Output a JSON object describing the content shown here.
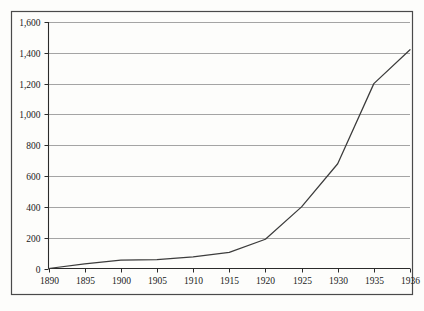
{
  "chart_data": {
    "type": "line",
    "title": "",
    "subtitle": "",
    "xlabel": "",
    "ylabel": "",
    "x": [
      1890,
      1895,
      1900,
      1905,
      1910,
      1915,
      1920,
      1925,
      1930,
      1935,
      1936
    ],
    "values": [
      0,
      30,
      55,
      58,
      75,
      105,
      190,
      400,
      680,
      1200,
      1420
    ],
    "series": [
      {
        "name": "",
        "values": [
          0,
          30,
          55,
          58,
          75,
          105,
          190,
          400,
          680,
          1200,
          1420
        ]
      }
    ],
    "x_tick_labels": [
      "1890",
      "1895",
      "1900",
      "1905",
      "1910",
      "1915",
      "1920",
      "1925",
      "1930",
      "1935",
      "1936"
    ],
    "y_tick_labels": [
      "0",
      "200",
      "400",
      "600",
      "800",
      "1,000",
      "1,200",
      "1,400",
      "1,600"
    ],
    "y_ticks": [
      0,
      200,
      400,
      600,
      800,
      1000,
      1200,
      1400,
      1600
    ],
    "ylim": [
      0,
      1600
    ],
    "xlim": [
      1890,
      1936
    ],
    "grid": "horizontal",
    "legend": "none",
    "line_color": "#3c3c3c",
    "grid_color": "#9a9a9a",
    "axis_color": "#2b2b2b",
    "border_color": "#4a4a4a",
    "background_color": "#fdfdfb",
    "annotations": []
  },
  "figure": {
    "border_label": "chart-outer-border",
    "plot_label": "plot-area"
  }
}
